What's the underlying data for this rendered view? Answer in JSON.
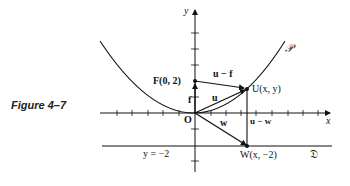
{
  "caption": "Figure 4–7",
  "axes": {
    "x_label": "x",
    "y_label": "y"
  },
  "points": {
    "origin": "O",
    "focus": "F(0, 2)",
    "point_on_parabola": "U(x, y)",
    "point_on_directrix": "W(x, −2)"
  },
  "vectors": {
    "f": "f",
    "u": "u",
    "w": "w",
    "u_minus_f": "u − f",
    "u_minus_w": "u − w"
  },
  "curves": {
    "parabola": "𝒫",
    "directrix_name": "𝔇",
    "directrix_equation": "y = −2"
  },
  "colors": {
    "ink": "#111111",
    "background": "#ffffff"
  }
}
